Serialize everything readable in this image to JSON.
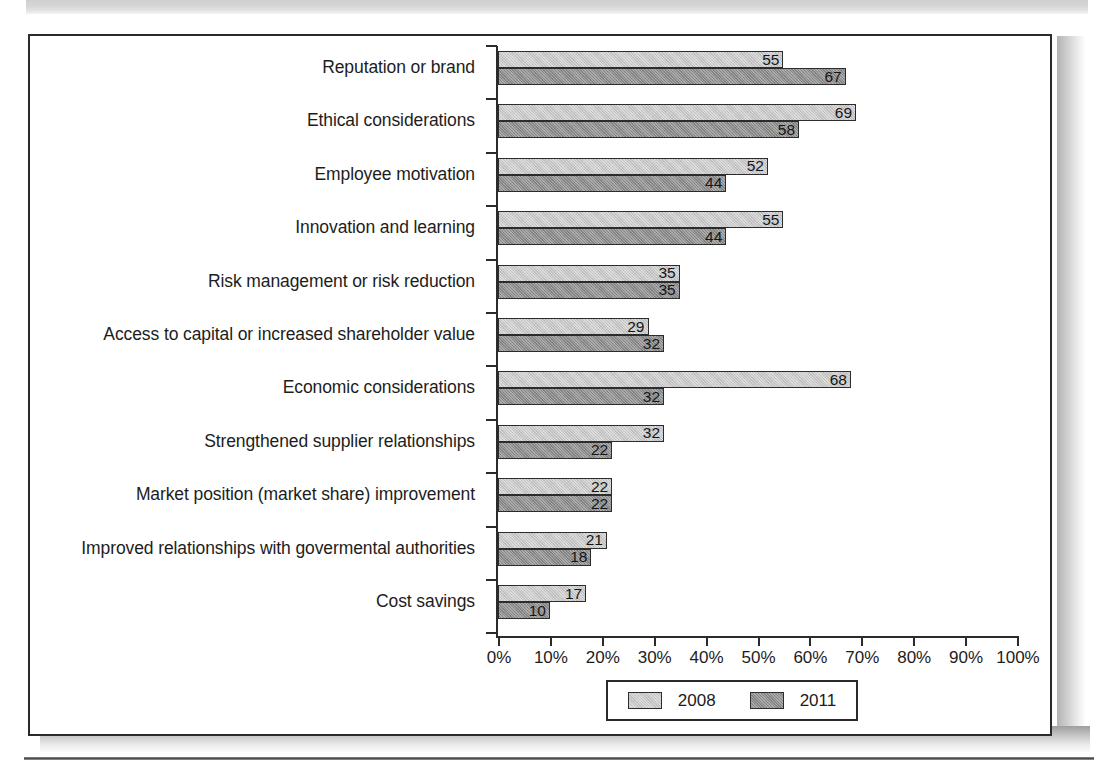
{
  "chart_data": {
    "type": "bar",
    "orientation": "horizontal",
    "title": "",
    "subtitle": "",
    "xlabel": "",
    "ylabel": "",
    "xlim": [
      0,
      100
    ],
    "xtick_labels": [
      "0%",
      "10%",
      "20%",
      "30%",
      "40%",
      "50%",
      "60%",
      "70%",
      "80%",
      "90%",
      "100%"
    ],
    "xticks": [
      0,
      10,
      20,
      30,
      40,
      50,
      60,
      70,
      80,
      90,
      100
    ],
    "grid": false,
    "legend_position": "bottom-center",
    "categories": [
      "Reputation or brand",
      "Ethical considerations",
      "Employee motivation",
      "Innovation and learning",
      "Risk management or risk reduction",
      "Access to capital or increased shareholder value",
      "Economic considerations",
      "Strengthened supplier relationships",
      "Market position (market share) improvement",
      "Improved relationships with govermental authorities",
      "Cost savings"
    ],
    "series": [
      {
        "name": "2008",
        "color": "#c6c6c6",
        "values": [
          55,
          69,
          52,
          55,
          35,
          29,
          68,
          32,
          22,
          21,
          17
        ]
      },
      {
        "name": "2011",
        "color": "#8a8a8a",
        "values": [
          67,
          58,
          44,
          44,
          35,
          32,
          32,
          22,
          22,
          18,
          10
        ]
      }
    ]
  },
  "legend": {
    "items": [
      {
        "label": "2008",
        "color": "#c6c6c6"
      },
      {
        "label": "2011",
        "color": "#8a8a8a"
      }
    ]
  }
}
